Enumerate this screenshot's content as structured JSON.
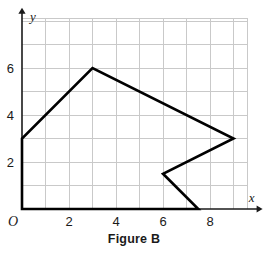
{
  "caption": "Figure B",
  "chart_data": {
    "type": "scatter",
    "title": "Figure B",
    "xlabel": "x",
    "ylabel": "y",
    "xlim": [
      0,
      9.6
    ],
    "ylim": [
      0,
      8.1
    ],
    "grid": true,
    "grid_spacing": 1,
    "legend": "none",
    "x_tick_labels": [
      "2",
      "4",
      "6",
      "8"
    ],
    "x_tick_values": [
      2,
      4,
      6,
      8
    ],
    "y_tick_labels": [
      "2",
      "4",
      "6"
    ],
    "y_tick_values": [
      2,
      4,
      6
    ],
    "origin_label": "O",
    "annotations": [
      {
        "name": "x-axis-name",
        "text": "x"
      },
      {
        "name": "y-axis-name",
        "text": "y"
      }
    ],
    "shapes": [
      {
        "name": "polygon-figure-b",
        "type": "polygon",
        "closed": true,
        "stroke": "#000000",
        "stroke_width": 2.6,
        "fill": "none",
        "vertices": [
          [
            0,
            0
          ],
          [
            0,
            3
          ],
          [
            3,
            6
          ],
          [
            9,
            3
          ],
          [
            6,
            1.5
          ],
          [
            7.5,
            0
          ]
        ]
      }
    ]
  },
  "colors": {
    "grid_line": "#c9c9c9",
    "axis_line": "#1a1a1a",
    "shape_stroke": "#000000",
    "text": "#1a1a1a",
    "background": "#ffffff"
  }
}
